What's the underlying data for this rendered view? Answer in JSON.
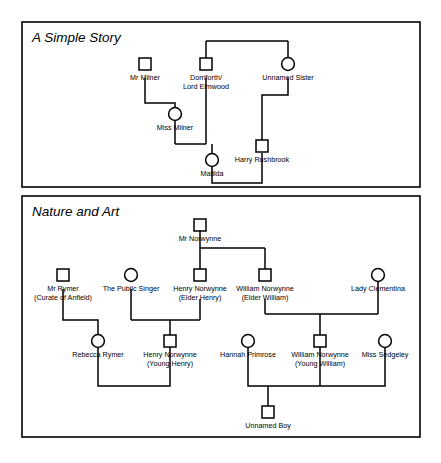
{
  "figure": {
    "type": "genogram",
    "background": "#ffffff",
    "line_color": "#000000",
    "width": 441,
    "height": 463
  },
  "panels": [
    {
      "id": "panel-a-simple-story",
      "title": "A Simple Story",
      "frame": {
        "x": 22,
        "y": 22,
        "w": 398,
        "h": 165
      },
      "people": [
        {
          "id": "mr_milner",
          "label": "Mr Milner",
          "sex": "male",
          "x": 145,
          "y": 64
        },
        {
          "id": "dorriforth",
          "label": "Dorriforth/",
          "label2": "Lord Elmwood",
          "sex": "male",
          "x": 206,
          "y": 64
        },
        {
          "id": "unnamed_sister",
          "label": "Unnamed Sister",
          "sex": "female",
          "x": 288,
          "y": 64
        },
        {
          "id": "miss_milner",
          "label": "Miss Milner",
          "sex": "female",
          "x": 175,
          "y": 114
        },
        {
          "id": "harry_rushbrook",
          "label": "Harry Rushbrook",
          "sex": "male",
          "x": 262,
          "y": 146
        },
        {
          "id": "matilda",
          "label": "Matilda",
          "sex": "female",
          "x": 212,
          "y": 160
        }
      ],
      "relations": [
        {
          "type": "sibling-bar",
          "desc": "Dorriforth and Unnamed Sister are siblings"
        },
        {
          "type": "marriage",
          "desc": "Mr Milner - Miss Milner (parent-child)"
        },
        {
          "type": "marriage",
          "desc": "Miss Milner + Dorriforth -> Matilda"
        },
        {
          "type": "marriage",
          "desc": "Unnamed Sister -> Harry Rushbrook"
        },
        {
          "type": "marriage",
          "desc": "Matilda + Harry Rushbrook"
        }
      ]
    },
    {
      "id": "panel-nature-and-art",
      "title": "Nature and Art",
      "frame": {
        "x": 22,
        "y": 196,
        "w": 398,
        "h": 241
      },
      "people": [
        {
          "id": "mr_norwynne",
          "label": "Mr Norwynne",
          "sex": "male",
          "x": 200,
          "y": 225
        },
        {
          "id": "mr_rymer",
          "label": "Mr Rymer",
          "label2": "(Curate of Anfield)",
          "sex": "male",
          "x": 63,
          "y": 275
        },
        {
          "id": "public_singer",
          "label": "The Public Singer",
          "sex": "female",
          "x": 131,
          "y": 275
        },
        {
          "id": "henry_elder",
          "label": "Henry Norwynne",
          "label2": "(Elder Henry)",
          "sex": "male",
          "x": 200,
          "y": 275
        },
        {
          "id": "william_elder",
          "label": "William Norwynne",
          "label2": "(Elder William)",
          "sex": "male",
          "x": 265,
          "y": 275
        },
        {
          "id": "lady_clementina",
          "label": "Lady Clementina",
          "sex": "female",
          "x": 378,
          "y": 275
        },
        {
          "id": "rebecca_rymer",
          "label": "Rebecca Rymer",
          "sex": "female",
          "x": 98,
          "y": 341
        },
        {
          "id": "henry_young",
          "label": "Henry Norwynne",
          "label2": "(Young Henry)",
          "sex": "male",
          "x": 170,
          "y": 341
        },
        {
          "id": "hannah_primrose",
          "label": "Hannah Primrose",
          "sex": "female",
          "x": 248,
          "y": 341
        },
        {
          "id": "william_young",
          "label": "William Norwynne",
          "label2": "(Young William)",
          "sex": "male",
          "x": 320,
          "y": 341
        },
        {
          "id": "miss_sedgeley",
          "label": "Miss Sedgeley",
          "sex": "female",
          "x": 385,
          "y": 341
        },
        {
          "id": "unnamed_boy",
          "label": "Unnamed Boy",
          "sex": "male",
          "x": 268,
          "y": 412
        }
      ],
      "relations": [
        {
          "type": "sibling-bar",
          "desc": "Elder Henry and Elder William are sons of Mr Norwynne"
        },
        {
          "type": "marriage",
          "desc": "Mr Rymer -> Rebecca Rymer"
        },
        {
          "type": "marriage",
          "desc": "The Public Singer + Elder Henry -> Young Henry"
        },
        {
          "type": "marriage",
          "desc": "Elder William + Lady Clementina -> Young William"
        },
        {
          "type": "marriage",
          "desc": "Rebecca Rymer + Young Henry"
        },
        {
          "type": "marriage",
          "desc": "Hannah Primrose + Young William -> Unnamed Boy"
        },
        {
          "type": "marriage",
          "desc": "Young William + Miss Sedgeley"
        }
      ]
    }
  ]
}
